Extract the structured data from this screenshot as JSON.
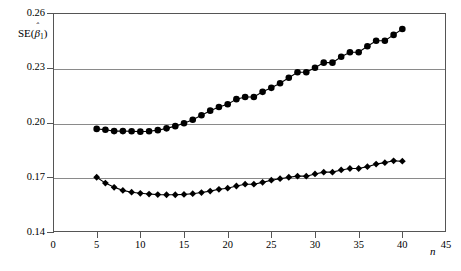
{
  "chart_data": {
    "type": "scatter",
    "title": "",
    "subtitle": "",
    "xlabel": "n",
    "ylabel": "SE(β̅1)",
    "ylabel_parts": {
      "prefix": "SE(",
      "beta": "β",
      "hat": "ˆ",
      "sub": "1",
      "suffix": ")"
    },
    "xlim": [
      0,
      45
    ],
    "ylim": [
      0.14,
      0.26
    ],
    "xticks": [
      0,
      5,
      10,
      15,
      20,
      25,
      30,
      35,
      40,
      45
    ],
    "yticks": [
      0.14,
      0.17,
      0.2,
      0.23,
      0.26
    ],
    "xticklabels": [
      "0",
      "5",
      "10",
      "15",
      "20",
      "25",
      "30",
      "35",
      "40",
      "45"
    ],
    "yticklabels": [
      "0.14",
      "0.17",
      "0.20",
      "0.23",
      "0.26"
    ],
    "grid": "horizontal",
    "gridlines_y": [
      0.17,
      0.2,
      0.23
    ],
    "legend": "none",
    "marker_color": "#000000",
    "line_color": "#000000",
    "series": [
      {
        "name": "upper",
        "marker": "circle",
        "x": [
          5,
          6,
          7,
          8,
          9,
          10,
          11,
          12,
          13,
          14,
          15,
          16,
          17,
          18,
          19,
          20,
          21,
          22,
          23,
          24,
          25,
          26,
          27,
          28,
          29,
          30,
          31,
          32,
          33,
          34,
          35,
          36,
          37,
          38,
          39,
          40
        ],
        "values": [
          0.1965,
          0.196,
          0.1953,
          0.1953,
          0.1952,
          0.195,
          0.1952,
          0.1958,
          0.1968,
          0.198,
          0.1996,
          0.2015,
          0.204,
          0.2065,
          0.2085,
          0.21,
          0.2128,
          0.214,
          0.214,
          0.2168,
          0.219,
          0.2215,
          0.2245,
          0.2275,
          0.2275,
          0.23,
          0.2328,
          0.2328,
          0.236,
          0.2385,
          0.2385,
          0.2418,
          0.2448,
          0.2448,
          0.248,
          0.2512
        ]
      },
      {
        "name": "lower",
        "marker": "diamond",
        "x": [
          5,
          6,
          7,
          8,
          9,
          10,
          11,
          12,
          13,
          14,
          15,
          16,
          17,
          18,
          19,
          20,
          21,
          22,
          23,
          24,
          25,
          26,
          27,
          28,
          29,
          30,
          31,
          32,
          33,
          34,
          35,
          36,
          37,
          38,
          39,
          40
        ],
        "values": [
          0.17,
          0.1668,
          0.1645,
          0.1628,
          0.1618,
          0.1612,
          0.1608,
          0.1605,
          0.1604,
          0.1604,
          0.1606,
          0.161,
          0.1616,
          0.1624,
          0.1634,
          0.164,
          0.1652,
          0.1662,
          0.1662,
          0.1672,
          0.1684,
          0.1692,
          0.17,
          0.1706,
          0.1706,
          0.1718,
          0.1728,
          0.1728,
          0.174,
          0.1748,
          0.1748,
          0.1758,
          0.1772,
          0.178,
          0.179,
          0.1788
        ]
      }
    ]
  }
}
